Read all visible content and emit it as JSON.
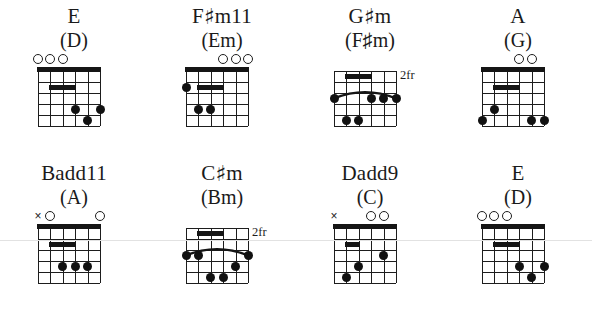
{
  "page": {
    "background_color": "#ffffff",
    "ink_color": "#1a1a1a",
    "strings": 6,
    "frets": 5
  },
  "labels": {
    "open_marker": "O",
    "muted_marker": "×",
    "sharp_symbol": "♯",
    "fret_suffix": "fr"
  },
  "rows": [
    {
      "row_index": 0,
      "chords": [
        {
          "name_main": "E",
          "name_sharp": "",
          "name_tail": "",
          "name_alt": "(D)",
          "fret_label": "",
          "markers": [
            {
              "string": 1,
              "type": "open"
            },
            {
              "string": 2,
              "type": "open"
            },
            {
              "string": 3,
              "type": "open"
            }
          ],
          "bars": [
            {
              "fret": 2,
              "string_from": 2,
              "string_to": 4
            }
          ],
          "arcs": [],
          "dots": [
            {
              "string": 4,
              "fret": 4
            },
            {
              "string": 6,
              "fret": 4
            },
            {
              "string": 5,
              "fret": 5
            }
          ]
        },
        {
          "name_main": "F",
          "name_sharp": "♯",
          "name_tail": "m11",
          "name_alt": "(Em)",
          "fret_label": "",
          "markers": [
            {
              "string": 4,
              "type": "open"
            },
            {
              "string": 5,
              "type": "open"
            },
            {
              "string": 6,
              "type": "open"
            }
          ],
          "bars": [
            {
              "fret": 2,
              "string_from": 2,
              "string_to": 4
            }
          ],
          "arcs": [],
          "dots": [
            {
              "string": 1,
              "fret": 2
            },
            {
              "string": 2,
              "fret": 4
            },
            {
              "string": 3,
              "fret": 4
            }
          ]
        },
        {
          "name_main": "G",
          "name_sharp": "♯",
          "name_tail": "m",
          "name_alt": "(F♯m)",
          "fret_label": "2fr",
          "markers": [],
          "bars": [
            {
              "fret": 1,
              "string_from": 2,
              "string_to": 4
            }
          ],
          "arcs": [
            {
              "fret": 3,
              "string_from": 1,
              "string_to": 6
            }
          ],
          "dots": [
            {
              "string": 1,
              "fret": 3
            },
            {
              "string": 4,
              "fret": 3
            },
            {
              "string": 5,
              "fret": 3
            },
            {
              "string": 6,
              "fret": 3
            },
            {
              "string": 2,
              "fret": 5
            },
            {
              "string": 3,
              "fret": 5
            }
          ]
        },
        {
          "name_main": "A",
          "name_sharp": "",
          "name_tail": "",
          "name_alt": "(G)",
          "fret_label": "",
          "markers": [
            {
              "string": 4,
              "type": "open"
            },
            {
              "string": 5,
              "type": "open"
            }
          ],
          "bars": [
            {
              "fret": 2,
              "string_from": 2,
              "string_to": 4
            }
          ],
          "arcs": [],
          "dots": [
            {
              "string": 2,
              "fret": 4
            },
            {
              "string": 1,
              "fret": 5
            },
            {
              "string": 5,
              "fret": 5
            },
            {
              "string": 6,
              "fret": 5
            }
          ]
        }
      ]
    },
    {
      "row_index": 1,
      "chords": [
        {
          "name_main": "Badd11",
          "name_sharp": "",
          "name_tail": "",
          "name_alt": "(A)",
          "fret_label": "",
          "markers": [
            {
              "string": 1,
              "type": "muted"
            },
            {
              "string": 2,
              "type": "open"
            },
            {
              "string": 6,
              "type": "open"
            }
          ],
          "bars": [
            {
              "fret": 2,
              "string_from": 2,
              "string_to": 4
            }
          ],
          "arcs": [],
          "dots": [
            {
              "string": 3,
              "fret": 4
            },
            {
              "string": 4,
              "fret": 4
            },
            {
              "string": 5,
              "fret": 4
            }
          ]
        },
        {
          "name_main": "C",
          "name_sharp": "♯",
          "name_tail": "m",
          "name_alt": "(Bm)",
          "fret_label": "2fr",
          "markers": [],
          "bars": [
            {
              "fret": 1,
              "string_from": 2,
              "string_to": 4
            }
          ],
          "arcs": [
            {
              "fret": 3,
              "string_from": 1,
              "string_to": 6
            }
          ],
          "dots": [
            {
              "string": 1,
              "fret": 3
            },
            {
              "string": 2,
              "fret": 3
            },
            {
              "string": 6,
              "fret": 3
            },
            {
              "string": 5,
              "fret": 4
            },
            {
              "string": 3,
              "fret": 5
            },
            {
              "string": 4,
              "fret": 5
            }
          ]
        },
        {
          "name_main": "Dadd9",
          "name_sharp": "",
          "name_tail": "",
          "name_alt": "(C)",
          "fret_label": "",
          "markers": [
            {
              "string": 1,
              "type": "muted"
            },
            {
              "string": 4,
              "type": "open"
            },
            {
              "string": 5,
              "type": "open"
            }
          ],
          "bars": [
            {
              "fret": 2,
              "string_from": 2,
              "string_to": 3
            }
          ],
          "arcs": [],
          "dots": [
            {
              "string": 5,
              "fret": 3
            },
            {
              "string": 3,
              "fret": 4
            },
            {
              "string": 2,
              "fret": 5
            }
          ]
        },
        {
          "name_main": "E",
          "name_sharp": "",
          "name_tail": "",
          "name_alt": "(D)",
          "fret_label": "",
          "markers": [
            {
              "string": 1,
              "type": "open"
            },
            {
              "string": 2,
              "type": "open"
            },
            {
              "string": 3,
              "type": "open"
            }
          ],
          "bars": [
            {
              "fret": 2,
              "string_from": 2,
              "string_to": 4
            }
          ],
          "arcs": [],
          "dots": [
            {
              "string": 4,
              "fret": 4
            },
            {
              "string": 6,
              "fret": 4
            },
            {
              "string": 5,
              "fret": 5
            }
          ]
        }
      ]
    }
  ]
}
